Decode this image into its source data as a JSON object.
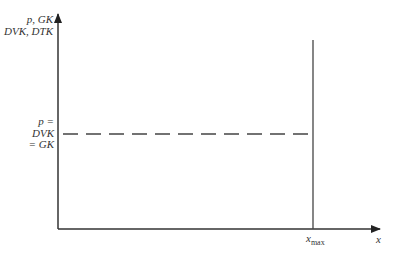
{
  "diagram": {
    "type": "economic-graph",
    "colors": {
      "axis": "#333333",
      "line": "#444444",
      "text": "#333333",
      "background": "#ffffff"
    },
    "y_axis": {
      "label_line1": "p, GK",
      "label_line2": "DVK, DTK"
    },
    "x_axis": {
      "label": "x",
      "tick_label_main": "x",
      "tick_label_sub": "max"
    },
    "horizontal_line": {
      "style": "dashed",
      "label_line1": "p =",
      "label_line2": "DVK",
      "label_line3": "= GK"
    },
    "vertical_line": {
      "style": "solid",
      "position_label": "x_max"
    }
  }
}
